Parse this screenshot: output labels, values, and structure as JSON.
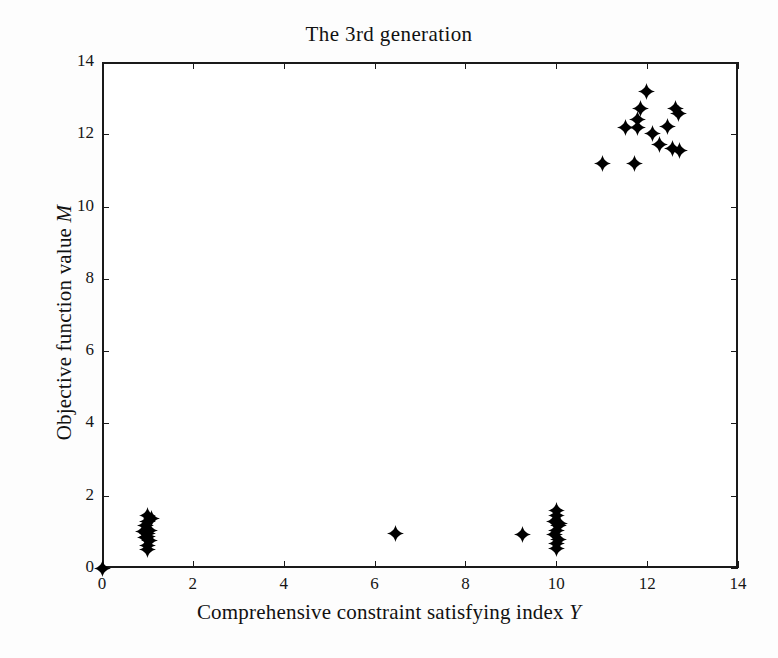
{
  "chart_data": {
    "type": "scatter",
    "title": "The 3rd  generation",
    "xlabel": "Comprehensive constraint satisfying index Y",
    "ylabel": "Objective function value M",
    "xlabel_text": "Comprehensive constraint satisfying index",
    "xlabel_symbol": "Y",
    "ylabel_text": "Objective function value",
    "ylabel_symbol": "M",
    "xlim": [
      0,
      14
    ],
    "ylim": [
      0,
      14
    ],
    "xticks": [
      0,
      2,
      4,
      6,
      8,
      10,
      12,
      14
    ],
    "yticks": [
      0,
      2,
      4,
      6,
      8,
      10,
      12,
      14
    ],
    "xticklabels": [
      "0",
      "2",
      "4",
      "6",
      "8",
      "10",
      "12",
      "14"
    ],
    "yticklabels": [
      "0",
      "2",
      "4",
      "6",
      "8",
      "10",
      "12",
      "14"
    ],
    "grid": false,
    "legend": null,
    "marker": "four-pointed-star",
    "marker_color": "#000000",
    "series": [
      {
        "name": "population",
        "points": [
          [
            1.0,
            1.45
          ],
          [
            1.0,
            1.3
          ],
          [
            0.95,
            1.18
          ],
          [
            1.05,
            1.05
          ],
          [
            1.0,
            0.95
          ],
          [
            0.95,
            0.85
          ],
          [
            1.05,
            0.75
          ],
          [
            1.0,
            0.62
          ],
          [
            1.0,
            0.52
          ],
          [
            1.08,
            1.38
          ],
          [
            0.92,
            1.0
          ],
          [
            1.0,
            0.88
          ],
          [
            6.45,
            0.95
          ],
          [
            9.25,
            0.93
          ],
          [
            10.0,
            1.58
          ],
          [
            10.0,
            1.45
          ],
          [
            9.95,
            1.3
          ],
          [
            10.05,
            1.18
          ],
          [
            10.0,
            1.05
          ],
          [
            9.95,
            0.92
          ],
          [
            10.05,
            0.8
          ],
          [
            10.0,
            0.68
          ],
          [
            10.0,
            0.55
          ],
          [
            10.08,
            1.22
          ],
          [
            11.02,
            11.2
          ],
          [
            11.72,
            11.18
          ],
          [
            11.52,
            12.18
          ],
          [
            11.78,
            12.2
          ],
          [
            11.78,
            12.42
          ],
          [
            11.85,
            12.72
          ],
          [
            11.98,
            13.18
          ],
          [
            12.12,
            12.02
          ],
          [
            12.28,
            11.72
          ],
          [
            12.45,
            12.22
          ],
          [
            12.62,
            12.7
          ],
          [
            12.68,
            12.58
          ],
          [
            12.55,
            11.6
          ],
          [
            12.72,
            11.55
          ]
        ]
      }
    ]
  }
}
